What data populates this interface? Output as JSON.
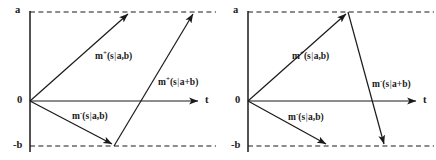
{
  "figure": {
    "type": "two-panel-vector-diagram",
    "width": 436,
    "height": 160,
    "background": "#ffffff",
    "stroke_color": "#1a1a1a",
    "dash_color": "#1a1a1a"
  },
  "panels": [
    {
      "id": "left",
      "axis": {
        "y_top_label": "a",
        "y_origin_label": "0",
        "y_bottom_label": "-b",
        "x_label": "t"
      },
      "vectors": [
        {
          "name": "m-plus-s-given-a-b",
          "label_main": "m",
          "label_sup": "+",
          "label_rest_left": "(s",
          "label_bar": "|",
          "label_rest_right": "a,b)",
          "label_text": "m+(s|a,b)",
          "from": [
            30,
            101
          ],
          "to": [
            130,
            12
          ],
          "label_at": [
            95,
            52
          ]
        },
        {
          "name": "m-minus-s-given-a-b",
          "label_main": "m",
          "label_sup": "-",
          "label_rest_left": "(s",
          "label_bar": "|",
          "label_rest_right": "a,b)",
          "label_text": "m-(s|a,b)",
          "from": [
            30,
            101
          ],
          "to": [
            114,
            146
          ],
          "label_at": [
            72,
            112
          ]
        },
        {
          "name": "m-plus-s-given-a-plus-b",
          "label_main": "m",
          "label_sup": "+",
          "label_rest_left": "(s",
          "label_bar": "|",
          "label_rest_right": "a+b)",
          "label_text": "m+(s|a+b)",
          "from": [
            114,
            146
          ],
          "to": [
            195,
            12
          ],
          "label_at": [
            158,
            78
          ]
        }
      ]
    },
    {
      "id": "right",
      "axis": {
        "y_top_label": "a",
        "y_origin_label": "0",
        "y_bottom_label": "-b",
        "x_label": "t"
      },
      "vectors": [
        {
          "name": "m-plus-s-given-a-b",
          "label_main": "m",
          "label_sup": "+",
          "label_rest_left": "(s",
          "label_bar": "|",
          "label_rest_right": "a,b)",
          "label_text": "m+(s|a,b)",
          "from": [
            30,
            101
          ],
          "to": [
            130,
            12
          ],
          "label_at": [
            74,
            52
          ]
        },
        {
          "name": "m-minus-s-given-a-b",
          "label_main": "m",
          "label_sup": "-",
          "label_rest_left": "(s",
          "label_bar": "|",
          "label_rest_right": "a,b)",
          "label_text": "m-(s|a,b)",
          "from": [
            30,
            101
          ],
          "to": [
            110,
            146
          ],
          "label_at": [
            70,
            113
          ]
        },
        {
          "name": "m-minus-s-given-a-plus-b",
          "label_main": "m",
          "label_sup": "-",
          "label_rest_left": "(s",
          "label_bar": "|",
          "label_rest_right": "a+b)",
          "label_text": "m-(s|a+b)",
          "from": [
            130,
            12
          ],
          "to": [
            167,
            146
          ],
          "label_at": [
            154,
            80
          ]
        }
      ]
    }
  ]
}
